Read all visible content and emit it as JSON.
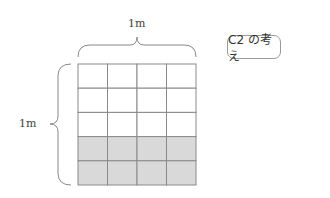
{
  "diagram": {
    "top_dimension_label": "1m",
    "left_dimension_label": "1m",
    "caption_box_label": "C2 の考え",
    "grid": {
      "columns": 4,
      "rows": 5,
      "shaded_rows_from_bottom": 2,
      "shaded_fraction": 0.4
    },
    "colors": {
      "shade": "#d9d9d9",
      "line": "#8a8a8a",
      "brace": "#888888"
    }
  }
}
